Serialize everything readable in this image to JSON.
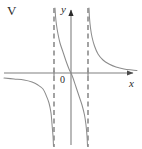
{
  "figure": {
    "option_label": "V",
    "background_color": "#ffffff",
    "width": 142,
    "height": 149
  },
  "labels": {
    "y_axis": "y",
    "x_axis": "x",
    "origin": "0"
  },
  "chart_data": {
    "type": "line",
    "title": "",
    "subtitle": "",
    "xlabel": "x",
    "ylabel": "y",
    "grid": false,
    "legend": null,
    "axes": {
      "origin_px": {
        "x": 71,
        "y": 73
      },
      "x_axis_y_px": 73,
      "y_axis_x_px": 71,
      "x_axis_extent_px": [
        4,
        137
      ],
      "y_axis_extent_px": [
        8,
        145
      ],
      "x_arrow": true,
      "y_arrow": true,
      "axis_color": "#808080"
    },
    "asymptotes": [
      {
        "name": "left-asymptote",
        "type": "vertical",
        "x_px": 54,
        "style": "dashed",
        "color": "#8c8c8c"
      },
      {
        "name": "right-asymptote",
        "type": "vertical",
        "x_px": 88,
        "style": "dashed",
        "color": "#8c8c8c"
      }
    ],
    "ticks": [
      {
        "axis": "x",
        "x_px": 54
      },
      {
        "axis": "x",
        "x_px": 88
      }
    ],
    "series": [
      {
        "name": "left-branch",
        "description": "Decreasing branch below the x-axis on the far left; approaches y=0 from below as x decreases, falls to negative infinity at the left asymptote.",
        "color": "#8c8c8c",
        "points_px": [
          [
            4,
            78
          ],
          [
            14,
            79
          ],
          [
            24,
            80
          ],
          [
            32,
            82
          ],
          [
            38,
            85
          ],
          [
            43,
            89
          ],
          [
            46,
            95
          ],
          [
            49,
            103
          ],
          [
            51,
            113
          ],
          [
            52,
            124
          ],
          [
            53,
            136
          ],
          [
            53.5,
            146
          ]
        ]
      },
      {
        "name": "middle-branch",
        "description": "Decreasing branch passing through the origin; rises to positive infinity at the left asymptote and falls to negative infinity at the right asymptote.",
        "color": "#8c8c8c",
        "points_px": [
          [
            55,
            8
          ],
          [
            55.5,
            16
          ],
          [
            56.5,
            25
          ],
          [
            58,
            34
          ],
          [
            60,
            43
          ],
          [
            63,
            52
          ],
          [
            66,
            61
          ],
          [
            69,
            69
          ],
          [
            71,
            73
          ],
          [
            73,
            78
          ],
          [
            76,
            87
          ],
          [
            79,
            96
          ],
          [
            82,
            105
          ],
          [
            84.5,
            115
          ],
          [
            86,
            125
          ],
          [
            87,
            136
          ],
          [
            87.5,
            146
          ]
        ]
      },
      {
        "name": "right-branch",
        "description": "Decreasing branch above the x-axis on the right; drops from positive infinity at the right asymptote and approaches y=0 from above as x increases.",
        "color": "#8c8c8c",
        "points_px": [
          [
            89,
            8
          ],
          [
            89.5,
            18
          ],
          [
            90.5,
            28
          ],
          [
            92,
            37
          ],
          [
            94.5,
            46
          ],
          [
            98,
            54
          ],
          [
            103,
            60
          ],
          [
            109,
            64
          ],
          [
            116,
            67
          ],
          [
            124,
            69
          ],
          [
            132,
            70
          ],
          [
            137,
            70.5
          ]
        ]
      }
    ]
  }
}
